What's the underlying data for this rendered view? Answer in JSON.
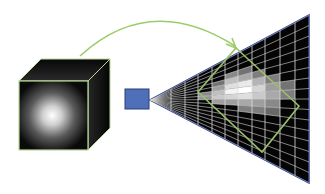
{
  "diagram": {
    "colors": {
      "background": "#ffffff",
      "cube_fill": "#0a0a0a",
      "cube_edge": "#b9d99a",
      "sphere_center": "#ffffff",
      "camera_fill": "#4f6fb8",
      "camera_stroke": "#2b3f77",
      "frustum_fill": "#050505",
      "frustum_edge": "#3d4a8a",
      "grid_line": "#d9d9d9",
      "arrow": "#9ccc6a",
      "projection_outline": "#9cbf6a"
    },
    "elements": {
      "cube": {
        "label": "volume-cube",
        "front": [
          19,
          81,
          69,
          69
        ],
        "depth_offset": [
          22,
          -22
        ]
      },
      "camera": {
        "label": "camera",
        "rect": [
          125,
          89,
          24,
          20
        ]
      },
      "frustum": {
        "apex": [
          150,
          100
        ],
        "right_x": 309,
        "top_y": 15,
        "bottom_y": 183
      },
      "arrow": {
        "label": "mapping-arrow",
        "start": [
          80,
          56
        ],
        "control": [
          150,
          -8
        ],
        "end": [
          236,
          48
        ]
      },
      "projection_square": {
        "points": [
          [
            236,
            48
          ],
          [
            299,
            106
          ],
          [
            262,
            152
          ],
          [
            198,
            92
          ]
        ]
      }
    },
    "grid": {
      "vertical_x": [
        171,
        185,
        198,
        212,
        225,
        238,
        252,
        265,
        280,
        295
      ],
      "rays": 16
    },
    "voxels": [
      {
        "c": 3,
        "r": 4,
        "v": 0.35
      },
      {
        "c": 4,
        "r": 3,
        "v": 0.45
      },
      {
        "c": 5,
        "r": 3,
        "v": 0.35
      },
      {
        "c": 3,
        "r": 5,
        "v": 0.55
      },
      {
        "c": 4,
        "r": 4,
        "v": 0.7
      },
      {
        "c": 5,
        "r": 4,
        "v": 0.6
      },
      {
        "c": 6,
        "r": 4,
        "v": 0.4
      },
      {
        "c": 2,
        "r": 6,
        "v": 0.45
      },
      {
        "c": 3,
        "r": 6,
        "v": 0.7
      },
      {
        "c": 4,
        "r": 5,
        "v": 0.85
      },
      {
        "c": 5,
        "r": 5,
        "v": 0.9
      },
      {
        "c": 6,
        "r": 5,
        "v": 0.65
      },
      {
        "c": 7,
        "r": 5,
        "v": 0.4
      },
      {
        "c": 2,
        "r": 7,
        "v": 0.5
      },
      {
        "c": 3,
        "r": 7,
        "v": 0.75
      },
      {
        "c": 4,
        "r": 6,
        "v": 0.95
      },
      {
        "c": 5,
        "r": 6,
        "v": 1.0
      },
      {
        "c": 6,
        "r": 6,
        "v": 0.8
      },
      {
        "c": 7,
        "r": 6,
        "v": 0.55
      },
      {
        "c": 8,
        "r": 6,
        "v": 0.35
      },
      {
        "c": 3,
        "r": 8,
        "v": 0.55
      },
      {
        "c": 4,
        "r": 7,
        "v": 0.8
      },
      {
        "c": 5,
        "r": 7,
        "v": 0.85
      },
      {
        "c": 6,
        "r": 7,
        "v": 0.75
      },
      {
        "c": 7,
        "r": 7,
        "v": 0.6
      },
      {
        "c": 8,
        "r": 7,
        "v": 0.4
      },
      {
        "c": 4,
        "r": 8,
        "v": 0.55
      },
      {
        "c": 5,
        "r": 8,
        "v": 0.6
      },
      {
        "c": 6,
        "r": 8,
        "v": 0.55
      },
      {
        "c": 7,
        "r": 8,
        "v": 0.45
      },
      {
        "c": 5,
        "r": 9,
        "v": 0.4
      },
      {
        "c": 6,
        "r": 9,
        "v": 0.4
      },
      {
        "c": 7,
        "r": 9,
        "v": 0.3
      }
    ]
  }
}
